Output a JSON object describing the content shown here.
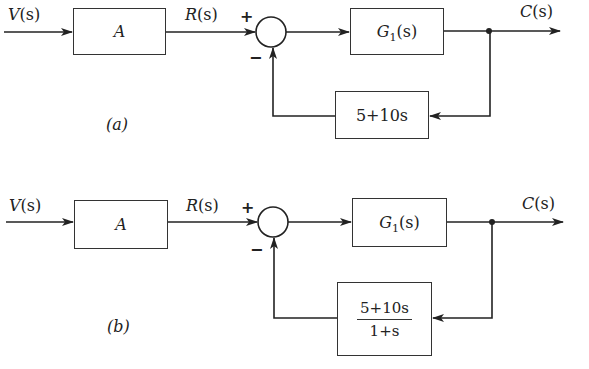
{
  "diagrams": [
    {
      "id": "a",
      "caption": "(a)",
      "input_label": "V(s)",
      "input_var": "V",
      "reference_label": "R(s)",
      "reference_var": "R",
      "output_label": "C(s)",
      "output_var": "C",
      "arg": "(s)",
      "blocks": {
        "gain": "A",
        "plant_name": "G",
        "plant_sub": "1",
        "plant_arg": "(s)",
        "feedback": "5+10s",
        "feedback_num": "5+10s",
        "feedback_den": ""
      },
      "summing_junction": {
        "plus": "+",
        "minus": "−"
      }
    },
    {
      "id": "b",
      "caption": "(b)",
      "input_label": "V(s)",
      "input_var": "V",
      "reference_label": "R(s)",
      "reference_var": "R",
      "output_label": "C(s)",
      "output_var": "C",
      "arg": "(s)",
      "blocks": {
        "gain": "A",
        "plant_name": "G",
        "plant_sub": "1",
        "plant_arg": "(s)",
        "feedback": "(5+10s)/(1+s)",
        "feedback_num": "5+10s",
        "feedback_den": "1+s"
      },
      "summing_junction": {
        "plus": "+",
        "minus": "−"
      }
    }
  ]
}
